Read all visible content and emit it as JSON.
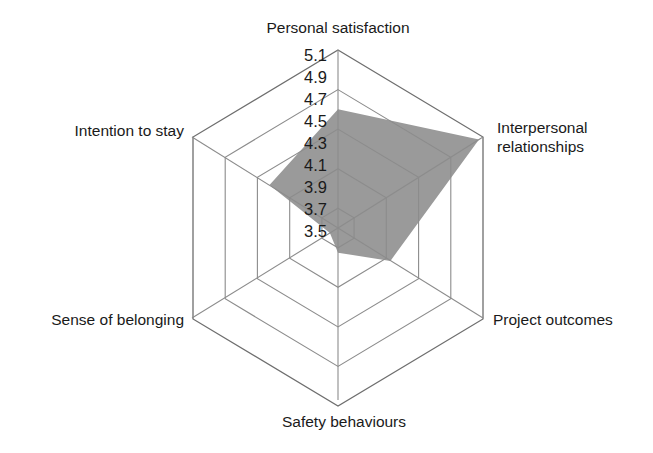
{
  "chart_data": {
    "type": "radar",
    "title": "",
    "subtitle": "",
    "xlabel": "",
    "ylabel": "",
    "grid": true,
    "legend": false,
    "legend_position": "none",
    "categories": [
      "Personal satisfaction",
      "Interpersonal relationships",
      "Project outcomes",
      "Safety behaviours",
      "Sense of belonging",
      "Intention to stay"
    ],
    "values": [
      4.5,
      5.05,
      3.95,
      3.55,
      3.4,
      4.15
    ],
    "series": [
      {
        "name": "Mean score",
        "values": [
          4.5,
          5.05,
          3.95,
          3.55,
          3.4,
          4.15
        ]
      }
    ],
    "tick_labels": [
      "5.1",
      "4.9",
      "4.7",
      "4.5",
      "4.3",
      "4.1",
      "3.9",
      "3.7",
      "3.5"
    ],
    "tick_values": [
      5.1,
      4.9,
      4.7,
      4.5,
      4.3,
      4.1,
      3.9,
      3.7,
      3.5
    ],
    "ring_values": [
      5.1,
      4.7,
      4.3,
      3.9,
      3.5
    ],
    "rlim": [
      3.3,
      5.1
    ],
    "axis_max": 5.1,
    "axis_min": 3.3,
    "fill_color": "#9a9a9a",
    "grid_color": "#8c8c8c",
    "text_color": "#1a1a1a",
    "background_color": "#ffffff"
  },
  "axis_labels": {
    "top": "Personal satisfaction",
    "right_line1": "Interpersonal",
    "right_line2": "relationships",
    "lower_right": "Project outcomes",
    "bottom": "Safety behaviours",
    "lower_left": "Sense of belonging",
    "left": "Intention to stay"
  },
  "ticks": {
    "t0": "5.1",
    "t1": "4.9",
    "t2": "4.7",
    "t3": "4.5",
    "t4": "4.3",
    "t5": "4.1",
    "t6": "3.9",
    "t7": "3.7",
    "t8": "3.5"
  }
}
